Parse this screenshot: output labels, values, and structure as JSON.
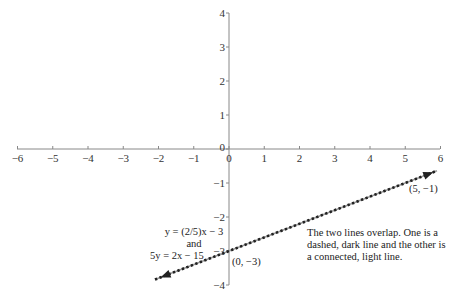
{
  "chart_data": {
    "type": "line",
    "title": "",
    "xlabel": "",
    "ylabel": "",
    "xlim": [
      -6,
      6
    ],
    "ylim": [
      -4,
      4
    ],
    "grid": false,
    "x_ticks": [
      "−6",
      "−5",
      "−4",
      "−3",
      "−2",
      "−1",
      "0",
      "1",
      "2",
      "3",
      "4",
      "5",
      "6"
    ],
    "y_ticks": [
      "4",
      "3",
      "2",
      "1",
      "0",
      "−1",
      "−2",
      "−3",
      "−4"
    ],
    "series": [
      {
        "name": "y = (2/5)x − 3",
        "style": "dashed, dark",
        "x": [
          -2.1,
          5.9
        ],
        "y": [
          -3.84,
          -0.64
        ]
      },
      {
        "name": "5y = 2x − 15",
        "style": "connected, light",
        "x": [
          -2.1,
          5.9
        ],
        "y": [
          -3.84,
          -0.64
        ]
      }
    ],
    "points": [
      {
        "label": "(0, −3)",
        "x": 0,
        "y": -3
      },
      {
        "label": "(5, −1)",
        "x": 5,
        "y": -1
      }
    ],
    "annotations": {
      "equation1": "y = (2/5)x − 3",
      "joiner": "and",
      "equation2": "5y = 2x − 15",
      "note": "The two lines overlap. One is a dashed, dark line and the other is a connected, light line."
    }
  }
}
